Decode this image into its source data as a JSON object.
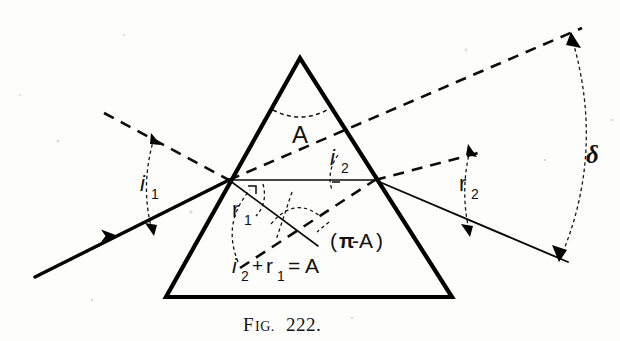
{
  "figure": {
    "caption": "FIG. 222.",
    "caption_prefix": "F",
    "caption_smallcaps": "IG.",
    "caption_number": "222.",
    "background_color": "#fdfdfc",
    "ink_color": "#000000"
  },
  "labels": {
    "apex_angle": "A",
    "incidence_angle_1": "i",
    "incidence_angle_1_sub": "1",
    "refraction_angle_1": "r",
    "refraction_angle_1_sub": "1",
    "incidence_angle_2": "i",
    "incidence_angle_2_sub": "2",
    "refraction_angle_2": "r",
    "refraction_angle_2_sub": "2",
    "deviation": "δ",
    "supplement_angle": "(π-A)",
    "supplement_open_paren": "(",
    "supplement_pi": "π",
    "supplement_minus_a": "-A",
    "supplement_close_paren": ")",
    "relation": "i₂ + r₁ = A",
    "relation_i": "i",
    "relation_i_sub": "2",
    "relation_plus": "+",
    "relation_r": "r",
    "relation_r_sub": "1",
    "relation_equals": "= A"
  },
  "geometry": {
    "prism": {
      "apex": [
        300,
        58
      ],
      "base_left": [
        166,
        297
      ],
      "base_right": [
        452,
        297
      ]
    },
    "entry_point": [
      229,
      180
    ],
    "exit_point": [
      375,
      180
    ],
    "incident_ray_start": [
      35,
      277
    ],
    "exit_ray_end": [
      568,
      262
    ],
    "normal_left_start": [
      104,
      113
    ],
    "normal_right_end": [
      582,
      28
    ],
    "deviation_arc_top": [
      570,
      35
    ],
    "deviation_arc_bottom": [
      557,
      258
    ]
  },
  "icon_names": {
    "arrowhead": "arrowhead-icon",
    "double_arrow_arc": "double-headed-arc-icon",
    "angle_marker": "angle-arc-icon"
  }
}
